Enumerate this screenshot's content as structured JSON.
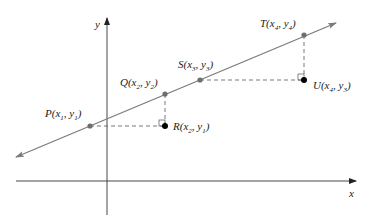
{
  "diagram": {
    "axes": {
      "x_label": "x",
      "y_label": "y"
    },
    "points": {
      "P": {
        "name": "P",
        "label_parts": [
          "P(",
          "x",
          "1",
          ", ",
          "y",
          "1",
          ")"
        ]
      },
      "Q": {
        "name": "Q",
        "label_parts": [
          "Q(",
          "x",
          "2",
          ", ",
          "y",
          "2",
          ")"
        ]
      },
      "R": {
        "name": "R",
        "label_parts": [
          "R(",
          "x",
          "2",
          ", ",
          "y",
          "1",
          ")"
        ]
      },
      "S": {
        "name": "S",
        "label_parts": [
          "S(",
          "x",
          "3",
          ", ",
          "y",
          "3",
          ")"
        ]
      },
      "T": {
        "name": "T",
        "label_parts": [
          "T(",
          "x",
          "4",
          ", ",
          "y",
          "4",
          ")"
        ]
      },
      "U": {
        "name": "U",
        "label_parts": [
          "U(",
          "x",
          "4",
          ", ",
          "y",
          "3",
          ")"
        ]
      }
    },
    "colors": {
      "line": "#7a7a7a",
      "axis": "#333333",
      "point_on_line": "#6e6e6e",
      "corner_point": "#000000",
      "dashed": "#555555"
    }
  }
}
